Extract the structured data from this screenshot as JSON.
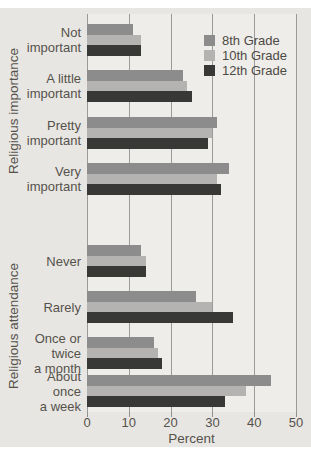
{
  "chart_data": {
    "type": "bar",
    "orientation": "horizontal",
    "xlabel": "Percent",
    "xlim": [
      0,
      50
    ],
    "x_ticks": [
      0,
      10,
      20,
      30,
      40,
      50
    ],
    "grid": "vertical",
    "legend_position": "top-right",
    "legend": [
      {
        "label": "8th Grade",
        "color": "#8c8c8c"
      },
      {
        "label": "10th Grade",
        "color": "#b4b3b1"
      },
      {
        "label": "12th Grade",
        "color": "#383836"
      }
    ],
    "colors": {
      "8th Grade": "#8c8c8c",
      "10th Grade": "#b4b3b1",
      "12th Grade": "#383836"
    },
    "sections": [
      {
        "axis_label": "Religious importance",
        "categories": [
          "Not important",
          "A little important",
          "Pretty important",
          "Very important"
        ],
        "display_lines": [
          [
            "Not",
            "important"
          ],
          [
            "A little",
            "important"
          ],
          [
            "Pretty",
            "important"
          ],
          [
            "Very",
            "important"
          ]
        ],
        "series": [
          {
            "name": "8th Grade",
            "values": [
              11,
              23,
              31,
              34
            ]
          },
          {
            "name": "10th Grade",
            "values": [
              13,
              24,
              30,
              31
            ]
          },
          {
            "name": "12th Grade",
            "values": [
              13,
              25,
              29,
              32
            ]
          }
        ]
      },
      {
        "axis_label": "Religious attendance",
        "categories": [
          "Never",
          "Rarely",
          "Once or twice a month",
          "About once a week"
        ],
        "display_lines": [
          [
            "Never"
          ],
          [
            "Rarely"
          ],
          [
            "Once or",
            "twice",
            "a month"
          ],
          [
            "About",
            "once",
            "a week"
          ]
        ],
        "series": [
          {
            "name": "8th Grade",
            "values": [
              13,
              26,
              16,
              44
            ]
          },
          {
            "name": "10th Grade",
            "values": [
              14,
              30,
              17,
              38
            ]
          },
          {
            "name": "12th Grade",
            "values": [
              14,
              35,
              18,
              33
            ]
          }
        ]
      }
    ]
  }
}
